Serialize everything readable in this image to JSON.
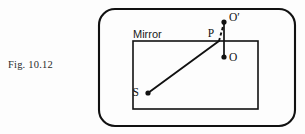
{
  "figure": {
    "caption": "Fig. 10.12",
    "background_color": "#fdfdfd",
    "ink_color": "#111111"
  },
  "diagram": {
    "outer_frame": {
      "name": "rounded-border",
      "x": 99,
      "y": 9,
      "width": 196,
      "height": 117,
      "corner_radius": 16,
      "stroke_width": 2.1
    },
    "mirror": {
      "label": "Mirror",
      "label_x": 133,
      "label_y": 38,
      "rect_x": 133,
      "rect_y": 41,
      "rect_width": 125,
      "rect_height": 68,
      "stroke_width": 1.6
    },
    "points": [
      {
        "id": "S",
        "label": "S",
        "x": 148,
        "y": 93,
        "label_x": 139,
        "label_y": 96,
        "dot_radius": 2.6,
        "description": "source-point"
      },
      {
        "id": "P",
        "label": "P",
        "x": 218,
        "y": 41,
        "label_x": 211,
        "label_y": 37,
        "dot_radius": 0,
        "description": "reflection-point-on-mirror"
      },
      {
        "id": "O_prime",
        "label": "O′",
        "x": 224,
        "y": 22,
        "label_x": 229,
        "label_y": 21,
        "dot_radius": 2.6,
        "description": "virtual-image-point"
      },
      {
        "id": "O",
        "label": "O",
        "x": 224,
        "y": 57,
        "label_x": 229,
        "label_y": 61,
        "dot_radius": 2.6,
        "description": "observer-point"
      }
    ],
    "segments": [
      {
        "id": "incident-ray",
        "from": "S",
        "to": "P",
        "x1": 148,
        "y1": 93,
        "x2": 219,
        "y2": 41,
        "style": "solid",
        "stroke_width": 1.9
      },
      {
        "id": "virtual-ray",
        "from": "P",
        "to": "O_prime",
        "x1": 219,
        "y1": 41,
        "x2": 224,
        "y2": 23,
        "style": "dashed",
        "stroke_width": 1.9,
        "dash_pattern": "3.2,2.4"
      },
      {
        "id": "object-image-axis",
        "from": "O_prime",
        "to": "O",
        "x1": 224,
        "y1": 22,
        "x2": 224,
        "y2": 57,
        "style": "solid",
        "stroke_width": 1.7
      }
    ]
  }
}
